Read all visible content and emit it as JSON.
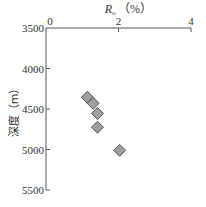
{
  "chart_data": {
    "type": "scatter",
    "title": "",
    "xlabel": {
      "main": "R",
      "sub": "o",
      "unit": "（%）"
    },
    "ylabel": "深度（m）",
    "xlim": [
      0,
      4
    ],
    "ylim": [
      3500,
      5500
    ],
    "x_axis_position": "top",
    "y_inverted": true,
    "x_ticks": [
      0,
      2,
      4
    ],
    "x_tick_labels": [
      "0",
      "2",
      "4"
    ],
    "y_ticks": [
      3500,
      4000,
      4500,
      5000,
      5500
    ],
    "y_tick_labels": [
      "3500",
      "4000",
      "4500",
      "5000",
      "5500"
    ],
    "grid": false,
    "marker": "diamond",
    "marker_color": "#9e9e9e",
    "series": [
      {
        "name": "Ro",
        "points": [
          {
            "x": 1.14,
            "y": 4355
          },
          {
            "x": 1.3,
            "y": 4430
          },
          {
            "x": 1.42,
            "y": 4555
          },
          {
            "x": 1.42,
            "y": 4725
          },
          {
            "x": 2.03,
            "y": 5010
          }
        ]
      }
    ]
  }
}
